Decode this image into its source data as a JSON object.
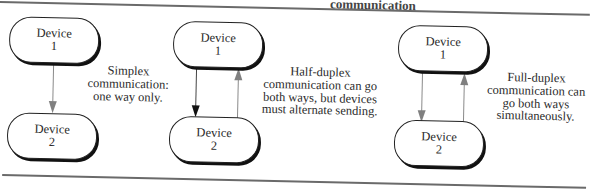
{
  "figure": {
    "title_fragment": "communication",
    "colors": {
      "rule": "#6a6a6a",
      "box_outline": "#222222",
      "box_shadow": "#111111",
      "arrow_gray": "#808080",
      "arrow_black": "#111111",
      "text": "#2a2a2a"
    }
  },
  "panels": [
    {
      "id": "simplex",
      "device1": {
        "line1": "Device",
        "line2": "1"
      },
      "device2": {
        "line1": "Device",
        "line2": "2"
      },
      "arrows": [
        {
          "direction": "down",
          "color": "gray"
        }
      ],
      "caption": [
        "Simplex",
        "communication:",
        "one way only."
      ]
    },
    {
      "id": "half-duplex",
      "device1": {
        "line1": "Device",
        "line2": "1"
      },
      "device2": {
        "line1": "Device",
        "line2": "2"
      },
      "arrows": [
        {
          "direction": "down",
          "color": "black"
        },
        {
          "direction": "up",
          "color": "gray"
        }
      ],
      "caption": [
        "Half-duplex",
        "communication can go",
        "both ways, but devices",
        "must alternate sending."
      ]
    },
    {
      "id": "full-duplex",
      "device1": {
        "line1": "Device",
        "line2": "1"
      },
      "device2": {
        "line1": "Device",
        "line2": "2"
      },
      "arrows": [
        {
          "direction": "down",
          "color": "gray"
        },
        {
          "direction": "up",
          "color": "gray"
        }
      ],
      "caption": [
        "Full-duplex",
        "communication can",
        "go both ways",
        "simultaneously."
      ]
    }
  ]
}
